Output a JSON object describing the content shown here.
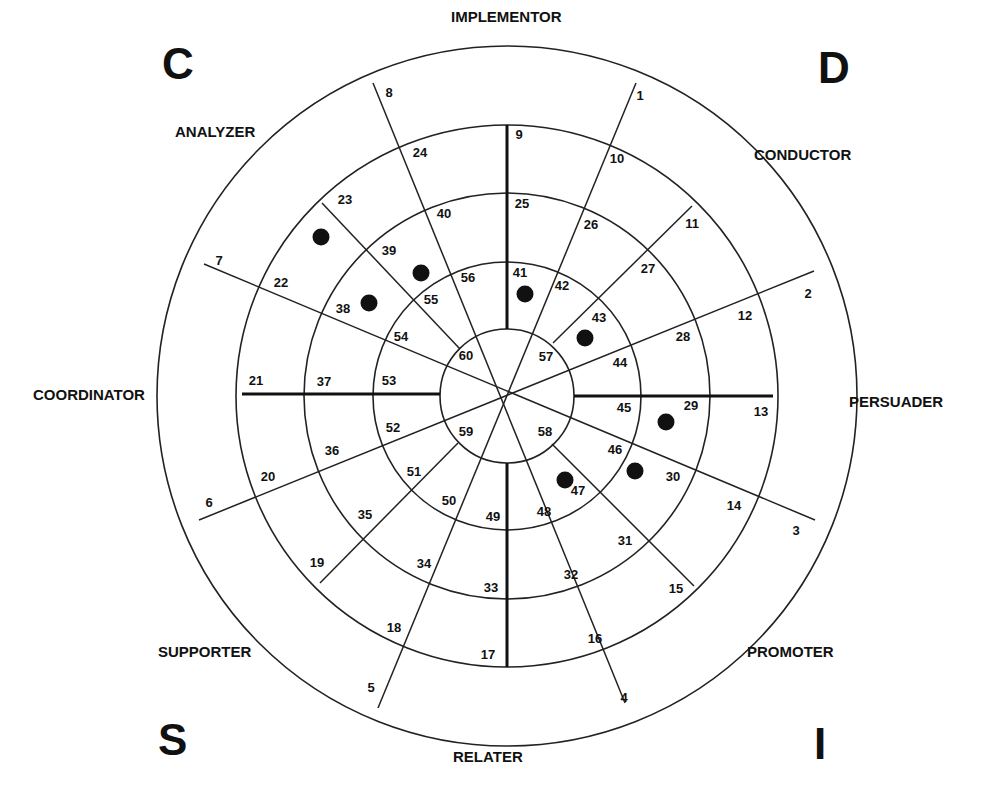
{
  "corners": [
    {
      "letter": "C",
      "x": 162,
      "y": 42
    },
    {
      "letter": "D",
      "x": 818,
      "y": 46
    },
    {
      "letter": "S",
      "x": 158,
      "y": 718
    },
    {
      "letter": "I",
      "x": 814,
      "y": 722
    }
  ],
  "style_labels": [
    {
      "text": "IMPLEMENTOR",
      "x": 451,
      "y": 8
    },
    {
      "text": "CONDUCTOR",
      "x": 754,
      "y": 146
    },
    {
      "text": "PERSUADER",
      "x": 849,
      "y": 393
    },
    {
      "text": "PROMOTER",
      "x": 747,
      "y": 643
    },
    {
      "text": "RELATER",
      "x": 453,
      "y": 748
    },
    {
      "text": "SUPPORTER",
      "x": 158,
      "y": 643
    },
    {
      "text": "COORDINATOR",
      "x": 33,
      "y": 386
    },
    {
      "text": "ANALYZER",
      "x": 175,
      "y": 123
    }
  ],
  "wheel": {
    "center": [
      507,
      396
    ],
    "radii": [
      67,
      134,
      203,
      271,
      350
    ],
    "ring_color": "#222222",
    "dot_color": "#111111"
  },
  "cell_numbers": [
    {
      "n": "1",
      "x": 640,
      "y": 100
    },
    {
      "n": "2",
      "x": 808,
      "y": 298
    },
    {
      "n": "3",
      "x": 796,
      "y": 535
    },
    {
      "n": "4",
      "x": 624,
      "y": 702
    },
    {
      "n": "5",
      "x": 371,
      "y": 692
    },
    {
      "n": "6",
      "x": 209,
      "y": 507
    },
    {
      "n": "7",
      "x": 219,
      "y": 265
    },
    {
      "n": "8",
      "x": 389,
      "y": 97
    },
    {
      "n": "9",
      "x": 519,
      "y": 139
    },
    {
      "n": "10",
      "x": 617,
      "y": 163
    },
    {
      "n": "11",
      "x": 692,
      "y": 228
    },
    {
      "n": "12",
      "x": 745,
      "y": 320
    },
    {
      "n": "13",
      "x": 761,
      "y": 416
    },
    {
      "n": "14",
      "x": 734,
      "y": 510
    },
    {
      "n": "15",
      "x": 676,
      "y": 593
    },
    {
      "n": "16",
      "x": 595,
      "y": 643
    },
    {
      "n": "17",
      "x": 488,
      "y": 659
    },
    {
      "n": "18",
      "x": 394,
      "y": 632
    },
    {
      "n": "19",
      "x": 317,
      "y": 567
    },
    {
      "n": "20",
      "x": 268,
      "y": 481
    },
    {
      "n": "21",
      "x": 256,
      "y": 385
    },
    {
      "n": "22",
      "x": 281,
      "y": 287
    },
    {
      "n": "23",
      "x": 345,
      "y": 204
    },
    {
      "n": "24",
      "x": 420,
      "y": 157
    },
    {
      "n": "25",
      "x": 522,
      "y": 208
    },
    {
      "n": "26",
      "x": 591,
      "y": 229
    },
    {
      "n": "27",
      "x": 648,
      "y": 273
    },
    {
      "n": "28",
      "x": 683,
      "y": 341
    },
    {
      "n": "29",
      "x": 691,
      "y": 410
    },
    {
      "n": "30",
      "x": 673,
      "y": 481
    },
    {
      "n": "31",
      "x": 625,
      "y": 545
    },
    {
      "n": "32",
      "x": 571,
      "y": 579
    },
    {
      "n": "33",
      "x": 491,
      "y": 592
    },
    {
      "n": "34",
      "x": 424,
      "y": 568
    },
    {
      "n": "35",
      "x": 365,
      "y": 519
    },
    {
      "n": "36",
      "x": 332,
      "y": 455
    },
    {
      "n": "37",
      "x": 324,
      "y": 386
    },
    {
      "n": "38",
      "x": 343,
      "y": 313
    },
    {
      "n": "39",
      "x": 389,
      "y": 255
    },
    {
      "n": "40",
      "x": 444,
      "y": 218
    },
    {
      "n": "41",
      "x": 520,
      "y": 277
    },
    {
      "n": "42",
      "x": 562,
      "y": 290
    },
    {
      "n": "43",
      "x": 599,
      "y": 322
    },
    {
      "n": "44",
      "x": 620,
      "y": 367
    },
    {
      "n": "45",
      "x": 624,
      "y": 412
    },
    {
      "n": "46",
      "x": 615,
      "y": 454
    },
    {
      "n": "47",
      "x": 578,
      "y": 495
    },
    {
      "n": "48",
      "x": 544,
      "y": 516
    },
    {
      "n": "49",
      "x": 493,
      "y": 521
    },
    {
      "n": "50",
      "x": 449,
      "y": 505
    },
    {
      "n": "51",
      "x": 414,
      "y": 476
    },
    {
      "n": "52",
      "x": 393,
      "y": 432
    },
    {
      "n": "53",
      "x": 389,
      "y": 385
    },
    {
      "n": "54",
      "x": 401,
      "y": 341
    },
    {
      "n": "55",
      "x": 431,
      "y": 304
    },
    {
      "n": "56",
      "x": 468,
      "y": 282
    },
    {
      "n": "57",
      "x": 546,
      "y": 361
    },
    {
      "n": "58",
      "x": 545,
      "y": 436
    },
    {
      "n": "59",
      "x": 466,
      "y": 436
    },
    {
      "n": "60",
      "x": 466,
      "y": 360
    }
  ],
  "marked_dots": [
    {
      "cell": "23",
      "x": 321,
      "y": 237
    },
    {
      "cell": "39",
      "x": 421,
      "y": 273
    },
    {
      "cell": "38",
      "x": 369,
      "y": 303
    },
    {
      "cell": "41",
      "x": 525,
      "y": 294
    },
    {
      "cell": "43",
      "x": 585,
      "y": 338
    },
    {
      "cell": "29",
      "x": 666,
      "y": 422
    },
    {
      "cell": "46",
      "x": 635,
      "y": 471
    },
    {
      "cell": "47",
      "x": 565,
      "y": 480
    }
  ]
}
